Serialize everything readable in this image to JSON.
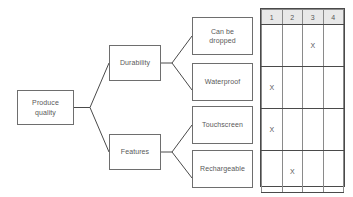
{
  "diagram": {
    "type": "tree-with-rating-matrix",
    "root": {
      "label": "Produce\nquality"
    },
    "branches": [
      {
        "label": "Durability"
      },
      {
        "label": "Features"
      }
    ],
    "leaves": [
      {
        "label": "Can be\ndropped"
      },
      {
        "label": "Waterproof"
      },
      {
        "label": "Touchscreen"
      },
      {
        "label": "Rechargeable"
      }
    ],
    "matrix": {
      "columns": [
        "1",
        "2",
        "3",
        "4"
      ],
      "rows": [
        {
          "name": "Can be dropped",
          "marks": [
            "",
            "",
            "X",
            ""
          ]
        },
        {
          "name": "Waterproof",
          "marks": [
            "X",
            "",
            "",
            ""
          ]
        },
        {
          "name": "Touchscreen",
          "marks": [
            "X",
            "",
            "",
            ""
          ]
        },
        {
          "name": "Rechargeable",
          "marks": [
            "",
            "X",
            "",
            ""
          ]
        }
      ]
    },
    "colors": {
      "node_border": "#6e6e6e",
      "text": "#595959",
      "matrix_border": "#4a4a4a",
      "header_fill": "#e8e8e8",
      "connector": "#4a4a4a"
    }
  }
}
